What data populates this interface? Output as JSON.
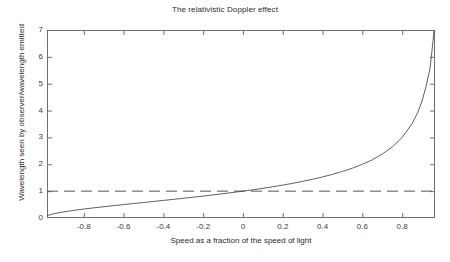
{
  "chart_data": {
    "type": "line",
    "title": "The relativistic Doppler effect",
    "xlabel": "Speed as a fraction of the speed of light",
    "ylabel": "Wavelength seen by observer/wavelength emitted",
    "xlim": [
      -0.985,
      0.965
    ],
    "ylim": [
      0,
      7
    ],
    "grid": false,
    "legend": "none",
    "xticks": [
      -0.8,
      -0.6,
      -0.4,
      -0.2,
      0,
      0.2,
      0.4,
      0.6,
      0.8
    ],
    "xtick_labels": [
      "-0.8",
      "-0.6",
      "-0.4",
      "-0.2",
      "0",
      "0.2",
      "0.4",
      "0.6",
      "0.8"
    ],
    "yticks": [
      0,
      1,
      2,
      3,
      4,
      5,
      6,
      7
    ],
    "ytick_labels": [
      "0",
      "1",
      "2",
      "3",
      "4",
      "5",
      "6",
      "7"
    ],
    "series": [
      {
        "name": "Relativistic Doppler factor",
        "style": "solid",
        "color": "#4d4d4d",
        "x": [
          -0.985,
          -0.96,
          -0.94,
          -0.92,
          -0.9,
          -0.85,
          -0.8,
          -0.75,
          -0.7,
          -0.65,
          -0.6,
          -0.55,
          -0.5,
          -0.45,
          -0.4,
          -0.35,
          -0.3,
          -0.25,
          -0.2,
          -0.15,
          -0.1,
          -0.05,
          0,
          0.05,
          0.1,
          0.15,
          0.2,
          0.25,
          0.3,
          0.35,
          0.4,
          0.45,
          0.5,
          0.55,
          0.6,
          0.65,
          0.7,
          0.75,
          0.8,
          0.85,
          0.88,
          0.9,
          0.92,
          0.94,
          0.95,
          0.955,
          0.96,
          0.965
        ],
        "y": [
          0.087,
          0.143,
          0.176,
          0.204,
          0.229,
          0.285,
          0.333,
          0.378,
          0.42,
          0.461,
          0.5,
          0.539,
          0.577,
          0.616,
          0.655,
          0.693,
          0.734,
          0.775,
          0.816,
          0.861,
          0.905,
          0.952,
          1.0,
          1.051,
          1.106,
          1.162,
          1.225,
          1.291,
          1.363,
          1.442,
          1.528,
          1.626,
          1.732,
          1.856,
          2.0,
          2.166,
          2.38,
          2.646,
          3.0,
          3.512,
          3.958,
          4.359,
          4.899,
          5.568,
          6.245,
          6.588,
          7.0,
          7.479
        ]
      },
      {
        "name": "Unity reference line",
        "style": "dashed",
        "color": "#555555",
        "constant_y": 1
      }
    ]
  }
}
